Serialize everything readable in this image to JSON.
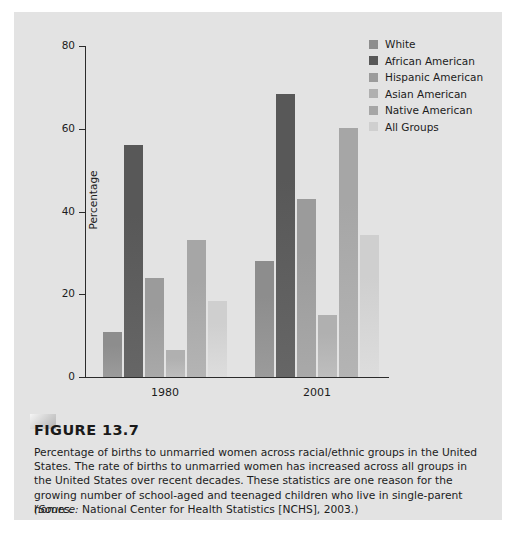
{
  "figure": {
    "title": "FIGURE 13.7",
    "caption": "Percentage of births to unmarried women across racial/ethnic groups in the United States. The rate of births to unmarried women has increased across all groups in the United States over recent decades. These statistics are one reason for the growing number of school-aged and teenaged children who live in single-parent homes.",
    "source_prefix": "(Source:",
    "source_rest": " National Center for Health Statistics [NCHS], 2003.)"
  },
  "colors": {
    "panel_background": "#e3e3e3",
    "page_background": "#ffffff",
    "axis": "#2b2b2b",
    "text": "#1c1c1c",
    "series": [
      "#8d8d8d",
      "#585858",
      "#9b9b9b",
      "#b0b0b0",
      "#a6a6a6",
      "#cfcfcf"
    ]
  },
  "chart_data": {
    "type": "bar",
    "title": "",
    "xlabel": "",
    "ylabel": "Percentage",
    "categories": [
      "1980",
      "2001"
    ],
    "ylim": [
      0,
      80
    ],
    "yticks": [
      0,
      20,
      40,
      60,
      80
    ],
    "ytick_labels": [
      "0",
      "20",
      "40",
      "60",
      "80"
    ],
    "grid": false,
    "legend_position": "top-right",
    "series": [
      {
        "name": "White",
        "color": "#8d8d8d",
        "values": [
          11,
          28
        ]
      },
      {
        "name": "African American",
        "color": "#585858",
        "values": [
          56,
          68.5
        ]
      },
      {
        "name": "Hispanic American",
        "color": "#9b9b9b",
        "values": [
          24,
          43
        ]
      },
      {
        "name": "Asian American",
        "color": "#b0b0b0",
        "values": [
          6.5,
          15
        ]
      },
      {
        "name": "Native American",
        "color": "#a6a6a6",
        "values": [
          33,
          60.3
        ]
      },
      {
        "name": "All Groups",
        "color": "#cfcfcf",
        "values": [
          18.3,
          34.3
        ]
      }
    ]
  }
}
